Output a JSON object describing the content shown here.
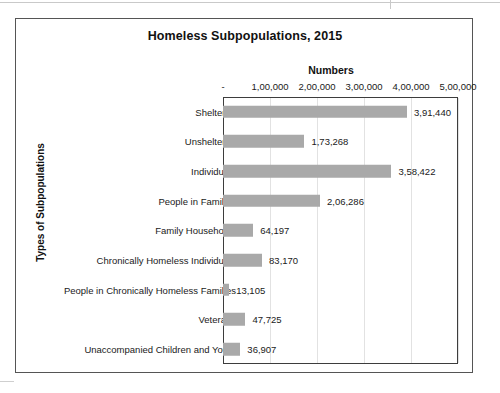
{
  "chart": {
    "title": "Homeless Subpopulations, 2015",
    "x_axis_title": "Numbers",
    "y_axis_title": "Types of Subpopulations",
    "bar_color": "#a9a9a9",
    "frame_color": "#555555",
    "gridline_color": "#e2e2e2"
  },
  "chart_data": {
    "type": "bar",
    "orientation": "horizontal",
    "title": "Homeless Subpopulations, 2015",
    "xlabel": "Numbers",
    "ylabel": "Types of Subpopulations",
    "xlim": [
      0,
      500000
    ],
    "grid": true,
    "legend": null,
    "tick_labels": [
      "-",
      "1,00,000",
      "2,00,000",
      "3,00,000",
      "4,00,000",
      "5,00,000"
    ],
    "tick_values": [
      0,
      100000,
      200000,
      300000,
      400000,
      500000
    ],
    "categories": [
      "Sheltered",
      "Unsheltered",
      "Individuals",
      "People in Families",
      "Family Households",
      "Chronically Homeless Individuals",
      "People in Chronically Homeless Families",
      "Veterans",
      "Unaccompanied Children and Youth"
    ],
    "values": [
      391440,
      173268,
      358422,
      206286,
      64197,
      83170,
      13105,
      47725,
      36907
    ],
    "value_labels": [
      "3,91,440",
      "1,73,268",
      "3,58,422",
      "2,06,286",
      "64,197",
      "83,170",
      "13,105",
      "47,725",
      "36,907"
    ]
  }
}
